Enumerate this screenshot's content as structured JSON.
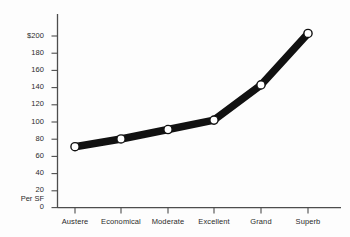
{
  "chart_data": {
    "type": "line",
    "title": "",
    "xlabel": "",
    "ylabel": "Per SF",
    "categories": [
      "Austere",
      "Economical",
      "Moderate",
      "Excellent",
      "Grand",
      "Superb"
    ],
    "values": [
      71,
      80,
      91,
      102,
      143,
      203
    ],
    "series": [
      {
        "name": "Cost Per SF",
        "values": [
          71,
          80,
          91,
          102,
          143,
          203
        ]
      }
    ],
    "ylim": [
      0,
      200
    ],
    "yticks": [
      0,
      20,
      40,
      60,
      80,
      100,
      120,
      140,
      160,
      180,
      200
    ],
    "ytick_labels": [
      "0",
      "20",
      "40",
      "60",
      "80",
      "100",
      "120",
      "140",
      "160",
      "180",
      "$200"
    ],
    "grid": false,
    "legend": false,
    "legend_position": "none",
    "line_color": "#111111",
    "marker_face_color": "#ffffff",
    "marker_edge_color": "#111111",
    "axis_color": "#4d4d4d",
    "background_color": "#fdfdfd"
  },
  "axis": {
    "y_axis_note": "Per SF"
  }
}
